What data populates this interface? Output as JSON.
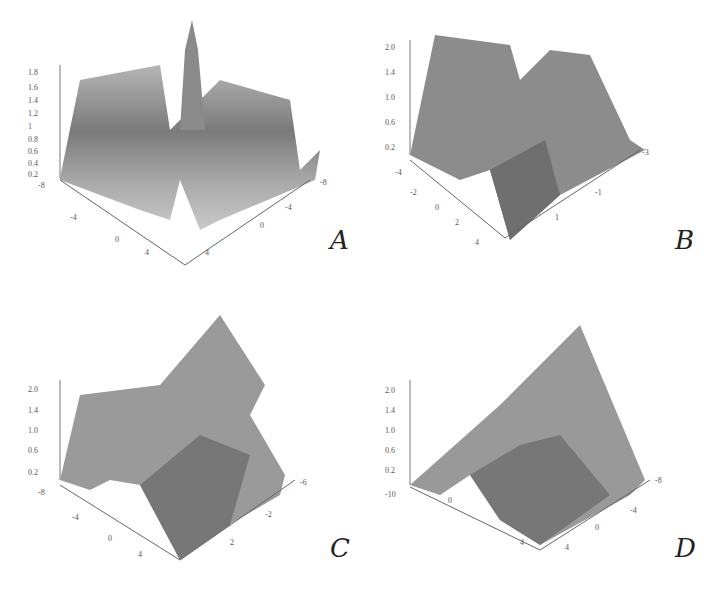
{
  "figure": {
    "panels": [
      {
        "id": "A",
        "label": "A",
        "zticks": [
          "0.2",
          "0.4",
          "0.6",
          "0.8",
          "1",
          "1.2",
          "1.4",
          "1.6",
          "1.8"
        ],
        "xticks": [
          "-8",
          "-4",
          "0",
          "4"
        ],
        "tticks": [
          "-8",
          "-4",
          "0",
          "4"
        ],
        "xlabel": "x",
        "tlabel": "t"
      },
      {
        "id": "B",
        "label": "B",
        "zticks": [
          "0.2",
          "0.6",
          "1.0",
          "1.4",
          "2.0"
        ],
        "xticks": [
          "-4",
          "-2",
          "0",
          "2",
          "4"
        ],
        "tticks": [
          "-3",
          "-1",
          "1"
        ],
        "xlabel": "x",
        "tlabel": "t"
      },
      {
        "id": "C",
        "label": "C",
        "zticks": [
          "0.2",
          "0.6",
          "1.0",
          "1.4",
          "2.0"
        ],
        "xticks": [
          "-8",
          "-4",
          "0",
          "4"
        ],
        "tticks": [
          "-6",
          "-2",
          "2"
        ],
        "xlabel": "x",
        "tlabel": "t"
      },
      {
        "id": "D",
        "label": "D",
        "zticks": [
          "0.2",
          "0.6",
          "1.0",
          "1.4",
          "2.0"
        ],
        "xticks": [
          "-10",
          "0",
          "4"
        ],
        "tticks": [
          "-8",
          "-4",
          "0",
          "4"
        ],
        "xlabel": "x",
        "tlabel": "t"
      }
    ]
  },
  "colors": {
    "surface_dark": "#6e6e6e",
    "surface_mid": "#9a9a9a",
    "surface_light": "#c4c4c4",
    "axis": "#666666"
  }
}
